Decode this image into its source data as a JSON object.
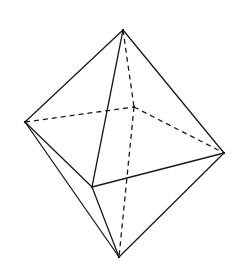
{
  "diagram": {
    "type": "octahedron",
    "stroke_color": "#1a1a1a",
    "background": "#ffffff",
    "vertices": {
      "top": [
        123,
        30
      ],
      "left": [
        25,
        122
      ],
      "back": [
        134,
        107
      ],
      "right": [
        224,
        153
      ],
      "front": [
        92,
        187
      ],
      "bottom": [
        119,
        257
      ]
    },
    "solid_edges": [
      [
        "top",
        "left"
      ],
      [
        "top",
        "front"
      ],
      [
        "top",
        "right"
      ],
      [
        "left",
        "front"
      ],
      [
        "left",
        "bottom"
      ],
      [
        "front",
        "right"
      ],
      [
        "front",
        "bottom"
      ],
      [
        "right",
        "bottom"
      ]
    ],
    "dashed_edges": [
      [
        "left",
        "back"
      ],
      [
        "back",
        "right"
      ],
      [
        "top",
        "back"
      ],
      [
        "back",
        "bottom"
      ]
    ]
  }
}
